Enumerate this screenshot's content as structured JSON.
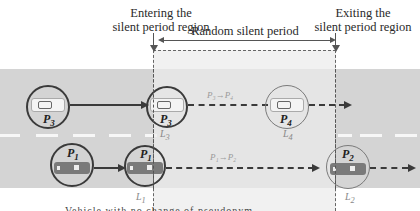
{
  "captions": {
    "entering": [
      "Entering the",
      "silent period region"
    ],
    "exiting": [
      "Exiting the",
      "silent period region"
    ],
    "random_period": "Random silent period"
  },
  "colors": {
    "road": "#d4d4d4",
    "silent_region": "#ececec",
    "lane_marking": "#f7f7f7",
    "outline": "#3a3a3a"
  },
  "upper_lane": {
    "vehicles": [
      {
        "label": "P",
        "sub": "3",
        "x": 40
      },
      {
        "label": "P",
        "sub": "3",
        "x": 162,
        "location": {
          "label": "L",
          "sub": "3"
        }
      },
      {
        "label": "P",
        "sub": "4",
        "x": 287,
        "location": {
          "label": "L",
          "sub": "4"
        },
        "faint": true
      }
    ],
    "transition": {
      "from": "P3",
      "to": "P4",
      "text": "P₃→P₄"
    }
  },
  "lower_lane": {
    "vehicles": [
      {
        "label": "P",
        "sub": "1",
        "x": 71
      },
      {
        "label": "P",
        "sub": "1",
        "x": 145,
        "location": {
          "label": "L",
          "sub": "1"
        }
      },
      {
        "label": "P",
        "sub": "2",
        "x": 346,
        "location": {
          "label": "L",
          "sub": "2"
        },
        "faint": true
      }
    ],
    "transition": {
      "from": "P1",
      "to": "P2",
      "text": "P₁→P₂"
    }
  },
  "bottom_caption_partial": "Vehicle with no change of pseudonym"
}
